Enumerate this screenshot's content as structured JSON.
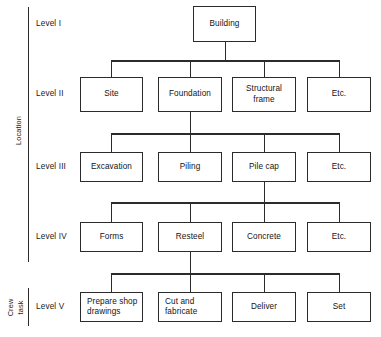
{
  "diagram": {
    "type": "work-breakdown-structure-tree",
    "orientation": "top-down",
    "groups": [
      {
        "id": "location",
        "label": "Location",
        "covers": [
          "Level I",
          "Level II",
          "Level III",
          "Level IV"
        ]
      },
      {
        "id": "crew-task",
        "label_line1": "Crew",
        "label_line2": "task",
        "covers": [
          "Level V"
        ]
      }
    ],
    "levels": [
      {
        "id": "level-1",
        "caption": "Level I",
        "nodes": [
          {
            "id": "building",
            "label": "Building",
            "column": "center",
            "align": "center"
          }
        ]
      },
      {
        "id": "level-2",
        "caption": "Level II",
        "parent": "building",
        "nodes": [
          {
            "id": "site",
            "label": "Site",
            "column": 1,
            "align": "center"
          },
          {
            "id": "foundation",
            "label": "Foundation",
            "column": 2,
            "align": "center"
          },
          {
            "id": "structural-frame",
            "label": "Structural\nframe",
            "column": 3,
            "align": "center"
          },
          {
            "id": "etc-2",
            "label": "Etc.",
            "column": 4,
            "align": "center"
          }
        ]
      },
      {
        "id": "level-3",
        "caption": "Level III",
        "parent": "foundation",
        "nodes": [
          {
            "id": "excavation",
            "label": "Excavation",
            "column": 1,
            "align": "center"
          },
          {
            "id": "piling",
            "label": "Piling",
            "column": 2,
            "align": "center"
          },
          {
            "id": "pile-cap",
            "label": "Pile cap",
            "column": 3,
            "align": "center"
          },
          {
            "id": "etc-3",
            "label": "Etc.",
            "column": 4,
            "align": "center"
          }
        ]
      },
      {
        "id": "level-4",
        "caption": "Level IV",
        "parent": "pile-cap",
        "nodes": [
          {
            "id": "forms",
            "label": "Forms",
            "column": 1,
            "align": "center"
          },
          {
            "id": "resteel",
            "label": "Resteel",
            "column": 2,
            "align": "center"
          },
          {
            "id": "concrete",
            "label": "Concrete",
            "column": 3,
            "align": "center"
          },
          {
            "id": "etc-4",
            "label": "Etc.",
            "column": 4,
            "align": "center"
          }
        ]
      },
      {
        "id": "level-5",
        "caption": "Level V",
        "parent": "resteel",
        "nodes": [
          {
            "id": "prepare-shop-drawings",
            "label": "Prepare shop\ndrawings",
            "column": 1,
            "align": "left"
          },
          {
            "id": "cut-and-fabricate",
            "label": "Cut and\nfabricate",
            "column": 2,
            "align": "left"
          },
          {
            "id": "deliver",
            "label": "Deliver",
            "column": 3,
            "align": "center"
          },
          {
            "id": "set",
            "label": "Set",
            "column": 4,
            "align": "center"
          }
        ]
      }
    ],
    "colors": {
      "stroke": "#2b2b2b",
      "text": "#141414",
      "background": "#ffffff"
    }
  }
}
